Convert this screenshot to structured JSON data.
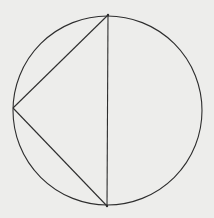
{
  "diagram": {
    "type": "geometry",
    "background": "#ededeb",
    "stroke_color": "#2e2e2e",
    "circle": {
      "cx": 107.5,
      "cy": 110.5,
      "r": 94.5
    },
    "points": {
      "top": {
        "x": 108,
        "y": 15
      },
      "bottom": {
        "x": 107,
        "y": 206
      },
      "left": {
        "x": 13,
        "y": 108
      }
    },
    "segments": [
      {
        "from": "top",
        "to": "bottom"
      },
      {
        "from": "top",
        "to": "left"
      },
      {
        "from": "left",
        "to": "bottom"
      }
    ]
  }
}
